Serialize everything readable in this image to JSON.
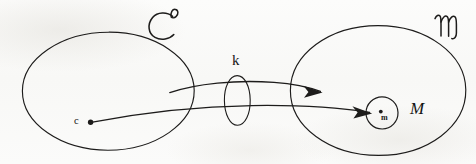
{
  "figure": {
    "kind": "hand-drawn-math-diagram",
    "background_color": "#fbfbfa",
    "ink_color": "#1d1c1b"
  },
  "labels": {
    "domain_set": "ℂ",
    "domain_set_alt": "C",
    "codomain_set": "𝕞",
    "codomain_set_alt": "m",
    "map_label": "k",
    "source_point": "c",
    "target_point": "m",
    "neighborhood": "M"
  },
  "shapes": {
    "left_ellipse": {
      "name": "domain-ellipse",
      "cx": 108,
      "cy": 91,
      "rx": 86,
      "ry": 59
    },
    "right_ellipse": {
      "name": "codomain-ellipse",
      "cx": 378,
      "cy": 90,
      "rx": 88,
      "ry": 65
    },
    "middle_ellipse": {
      "name": "map-ellipse",
      "cx": 237,
      "cy": 100,
      "rx": 13,
      "ry": 25
    },
    "inner_circle": {
      "name": "neighborhood-circle",
      "cx": 382,
      "cy": 113,
      "r": 16
    },
    "source_dot": {
      "name": "point-c",
      "cx": 90,
      "cy": 122,
      "r": 2.6
    },
    "target_dot": {
      "name": "point-m",
      "cx": 381,
      "cy": 112,
      "r": 1.9
    }
  },
  "arrows": [
    {
      "name": "map-arrow-k",
      "from": [
        170,
        92
      ],
      "to": [
        321,
        92
      ],
      "label": "k"
    },
    {
      "name": "element-arrow-c-to-m",
      "from": [
        92,
        122
      ],
      "to": [
        370,
        113
      ],
      "label": "c ↦ m"
    }
  ]
}
